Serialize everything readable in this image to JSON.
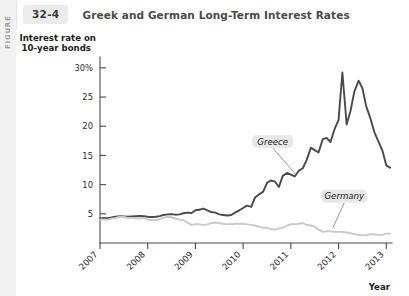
{
  "figure": {
    "rail_label": "FIGURE",
    "number": "32-4",
    "title": "Greek and German Long-Term Interest Rates"
  },
  "chart_data": {
    "type": "line",
    "title": "Greek and German Long-Term Interest Rates",
    "ylabel_line1": "Interest rate on",
    "ylabel_line2": "10-year bonds",
    "xlabel": "Year",
    "ylim": [
      0,
      31
    ],
    "xlim": [
      2007,
      2013.12
    ],
    "yticks": [
      5,
      10,
      15,
      20,
      25,
      30
    ],
    "ytick_labels": [
      "5",
      "10",
      "15",
      "20",
      "25",
      "30%"
    ],
    "xticks": [
      2007,
      2008,
      2009,
      2010,
      2011,
      2012,
      2013
    ],
    "xtick_labels": [
      "2007",
      "2008",
      "2009",
      "2010",
      "2011",
      "2012",
      "2013"
    ],
    "grid": false,
    "legend_position": "inline-callouts",
    "series": [
      {
        "name": "Greece",
        "color": "#4a4a4a",
        "width": 1.9,
        "label_x": 2010.62,
        "label_y": 17.4,
        "leader_to_x": 2011.12,
        "leader_to_y": 11.6,
        "x": [
          2007.0,
          2007.08,
          2007.17,
          2007.25,
          2007.33,
          2007.42,
          2007.5,
          2007.58,
          2007.67,
          2007.75,
          2007.83,
          2007.92,
          2008.0,
          2008.08,
          2008.17,
          2008.25,
          2008.33,
          2008.42,
          2008.5,
          2008.58,
          2008.67,
          2008.75,
          2008.83,
          2008.92,
          2009.0,
          2009.08,
          2009.17,
          2009.25,
          2009.33,
          2009.42,
          2009.5,
          2009.58,
          2009.67,
          2009.75,
          2009.83,
          2009.92,
          2010.0,
          2010.08,
          2010.17,
          2010.25,
          2010.33,
          2010.42,
          2010.5,
          2010.58,
          2010.67,
          2010.75,
          2010.83,
          2010.92,
          2011.0,
          2011.08,
          2011.17,
          2011.25,
          2011.33,
          2011.42,
          2011.5,
          2011.58,
          2011.67,
          2011.75,
          2011.83,
          2011.92,
          2012.0,
          2012.08,
          2012.17,
          2012.25,
          2012.33,
          2012.42,
          2012.5,
          2012.58,
          2012.67,
          2012.75,
          2012.83,
          2012.92,
          2013.0,
          2013.08
        ],
        "y": [
          4.2,
          4.3,
          4.25,
          4.4,
          4.5,
          4.6,
          4.55,
          4.5,
          4.55,
          4.6,
          4.65,
          4.6,
          4.5,
          4.45,
          4.5,
          4.6,
          4.8,
          4.9,
          4.95,
          4.85,
          4.9,
          5.1,
          5.2,
          5.15,
          5.6,
          5.7,
          5.9,
          5.6,
          5.3,
          5.2,
          4.9,
          4.8,
          4.7,
          4.8,
          5.2,
          5.6,
          6.0,
          6.4,
          6.2,
          7.8,
          8.3,
          8.8,
          10.3,
          10.7,
          10.5,
          9.6,
          11.5,
          12.0,
          11.7,
          11.4,
          12.4,
          12.8,
          14.2,
          16.3,
          15.9,
          15.5,
          17.8,
          18.0,
          17.3,
          19.6,
          21.1,
          29.2,
          20.3,
          22.6,
          25.9,
          27.8,
          26.5,
          23.4,
          21.3,
          19.0,
          17.5,
          15.8,
          13.3,
          12.9
        ]
      },
      {
        "name": "Germany",
        "color": "#c9c9c9",
        "width": 1.9,
        "label_x": 2012.12,
        "label_y": 8.0,
        "leader_to_x": 2011.88,
        "leader_to_y": 2.6,
        "x": [
          2007.0,
          2007.08,
          2007.17,
          2007.25,
          2007.33,
          2007.42,
          2007.5,
          2007.58,
          2007.67,
          2007.75,
          2007.83,
          2007.92,
          2008.0,
          2008.08,
          2008.17,
          2008.25,
          2008.33,
          2008.42,
          2008.5,
          2008.58,
          2008.67,
          2008.75,
          2008.83,
          2008.92,
          2009.0,
          2009.08,
          2009.17,
          2009.25,
          2009.33,
          2009.42,
          2009.5,
          2009.58,
          2009.67,
          2009.75,
          2009.83,
          2009.92,
          2010.0,
          2010.08,
          2010.17,
          2010.25,
          2010.33,
          2010.42,
          2010.5,
          2010.58,
          2010.67,
          2010.75,
          2010.83,
          2010.92,
          2011.0,
          2011.08,
          2011.17,
          2011.25,
          2011.33,
          2011.42,
          2011.5,
          2011.58,
          2011.67,
          2011.75,
          2011.83,
          2011.92,
          2012.0,
          2012.08,
          2012.17,
          2012.25,
          2012.33,
          2012.42,
          2012.5,
          2012.58,
          2012.67,
          2012.75,
          2012.83,
          2012.92,
          2013.0,
          2013.08
        ],
        "y": [
          4.0,
          4.05,
          4.0,
          4.2,
          4.3,
          4.5,
          4.45,
          4.3,
          4.3,
          4.25,
          4.2,
          4.3,
          4.0,
          3.9,
          3.9,
          4.1,
          4.3,
          4.5,
          4.4,
          4.2,
          4.0,
          3.9,
          3.5,
          3.1,
          3.2,
          3.2,
          3.1,
          3.2,
          3.4,
          3.5,
          3.4,
          3.3,
          3.2,
          3.2,
          3.3,
          3.3,
          3.3,
          3.2,
          3.1,
          3.0,
          2.8,
          2.6,
          2.6,
          2.4,
          2.3,
          2.5,
          2.6,
          3.0,
          3.2,
          3.2,
          3.3,
          3.4,
          3.1,
          3.0,
          2.8,
          2.3,
          1.9,
          2.0,
          2.0,
          1.9,
          1.9,
          1.9,
          1.8,
          1.7,
          1.5,
          1.4,
          1.3,
          1.4,
          1.5,
          1.5,
          1.4,
          1.4,
          1.6,
          1.6
        ]
      }
    ]
  }
}
